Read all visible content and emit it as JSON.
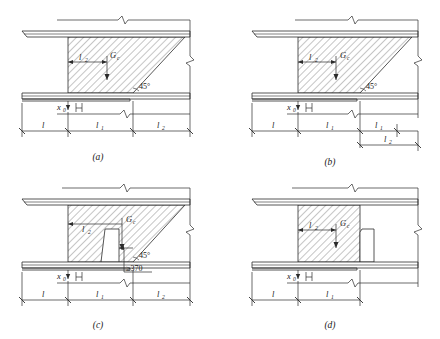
{
  "figure": {
    "stroke_color": "#2b2b2b",
    "hatch_color": "#6e6e6e",
    "background": "#ffffff"
  },
  "panels": [
    {
      "id": "a",
      "caption": "(a)",
      "has_slope": true,
      "slope_label": "45°",
      "has_notch": false,
      "min_note": "",
      "labels": {
        "width": "l",
        "width_sub": "2",
        "load": "G",
        "load_sub": "c",
        "offset": "x",
        "offset_sub": "0"
      },
      "dimensions_row1": [
        {
          "label": "l",
          "sub": ""
        },
        {
          "label": "l",
          "sub": "1"
        },
        {
          "label": "l",
          "sub": "2"
        }
      ],
      "dimensions_row2": []
    },
    {
      "id": "b",
      "caption": "(b)",
      "has_slope": true,
      "slope_label": "45°",
      "has_notch": false,
      "min_note": "",
      "labels": {
        "width": "l",
        "width_sub": "2",
        "load": "G",
        "load_sub": "c",
        "offset": "x",
        "offset_sub": "0"
      },
      "dimensions_row1": [
        {
          "label": "l",
          "sub": ""
        },
        {
          "label": "l",
          "sub": "1"
        },
        {
          "label": "l",
          "sub": "1"
        }
      ],
      "dimensions_row2": [
        {
          "label": "l",
          "sub": "2"
        }
      ]
    },
    {
      "id": "c",
      "caption": "(c)",
      "has_slope": true,
      "slope_label": "45°",
      "has_notch": true,
      "min_note": "≥370",
      "labels": {
        "width": "l",
        "width_sub": "2",
        "load": "G",
        "load_sub": "c",
        "offset": "x",
        "offset_sub": "0"
      },
      "dimensions_row1": [
        {
          "label": "l",
          "sub": ""
        },
        {
          "label": "l",
          "sub": "1"
        },
        {
          "label": "l",
          "sub": "2"
        }
      ],
      "dimensions_row2": []
    },
    {
      "id": "d",
      "caption": "(d)",
      "has_slope": false,
      "slope_label": "",
      "has_notch": true,
      "min_note": "",
      "labels": {
        "width": "l",
        "width_sub": "2",
        "load": "G",
        "load_sub": "c",
        "offset": "x",
        "offset_sub": "0"
      },
      "dimensions_row1": [
        {
          "label": "l",
          "sub": ""
        },
        {
          "label": "l",
          "sub": "1"
        }
      ],
      "dimensions_row2": []
    }
  ]
}
